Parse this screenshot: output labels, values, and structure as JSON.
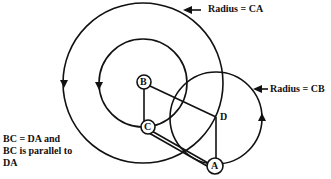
{
  "diagram": {
    "labels": {
      "radius_ca": "Radius = CA",
      "radius_cb": "Radius = CB",
      "note_line1": "BC = DA and",
      "note_line2": "BC is parallel to",
      "note_line3": "DA"
    },
    "points": {
      "B": "B",
      "C": "C",
      "D": "D",
      "A": "A"
    },
    "colors": {
      "stroke": "#111111",
      "background": "#ffffff"
    }
  }
}
